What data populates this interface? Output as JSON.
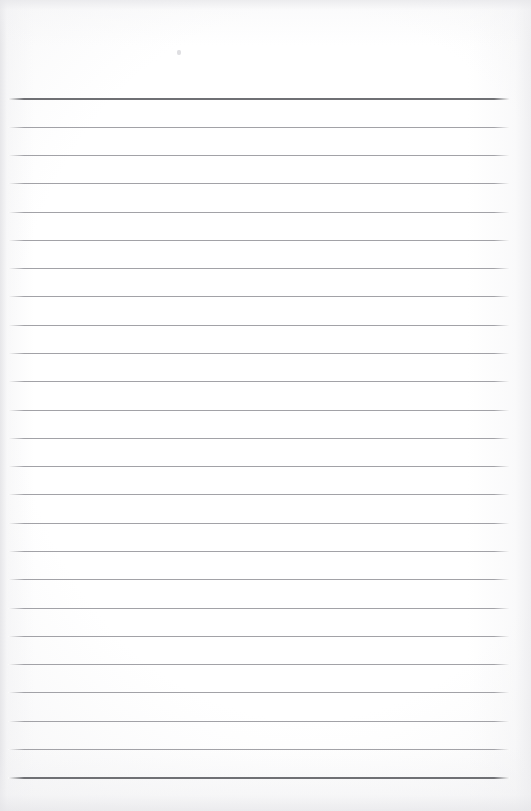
{
  "document": {
    "kind": "scanned-lined-paper",
    "title": "Blank ruled notebook page",
    "orientation": "portrait",
    "page_width_px": 531,
    "page_height_px": 811,
    "visible_text": "",
    "text_content_present": false
  },
  "colors": {
    "paper": "#fdfdfd",
    "paper_highlight": "#ffffff",
    "edge_shadow": "#e6e6e9",
    "rule_line": "#a2a2a7",
    "rule_line_heavy": "#6f7074",
    "speck": "#c4c4ca"
  },
  "ruling": {
    "style": "wide-ruled",
    "line_count": 25,
    "first_line_y": 98,
    "last_line_y": 777,
    "spacing_px": 28.3,
    "line_left_x": 8,
    "line_right_x": 510,
    "line_length_px": 502,
    "top_margin_px": 98,
    "bottom_margin_px": 34,
    "lines": [
      {
        "index": 1,
        "y": 98,
        "weight": "heavy"
      },
      {
        "index": 2,
        "y": 127,
        "weight": "normal"
      },
      {
        "index": 3,
        "y": 155,
        "weight": "normal"
      },
      {
        "index": 4,
        "y": 183,
        "weight": "normal"
      },
      {
        "index": 5,
        "y": 212,
        "weight": "normal"
      },
      {
        "index": 6,
        "y": 240,
        "weight": "normal"
      },
      {
        "index": 7,
        "y": 268,
        "weight": "normal"
      },
      {
        "index": 8,
        "y": 296,
        "weight": "normal"
      },
      {
        "index": 9,
        "y": 325,
        "weight": "normal"
      },
      {
        "index": 10,
        "y": 353,
        "weight": "normal"
      },
      {
        "index": 11,
        "y": 381,
        "weight": "normal"
      },
      {
        "index": 12,
        "y": 410,
        "weight": "normal"
      },
      {
        "index": 13,
        "y": 438,
        "weight": "normal"
      },
      {
        "index": 14,
        "y": 466,
        "weight": "normal"
      },
      {
        "index": 15,
        "y": 494,
        "weight": "normal"
      },
      {
        "index": 16,
        "y": 523,
        "weight": "normal"
      },
      {
        "index": 17,
        "y": 551,
        "weight": "normal"
      },
      {
        "index": 18,
        "y": 579,
        "weight": "normal"
      },
      {
        "index": 19,
        "y": 608,
        "weight": "normal"
      },
      {
        "index": 20,
        "y": 636,
        "weight": "normal"
      },
      {
        "index": 21,
        "y": 664,
        "weight": "normal"
      },
      {
        "index": 22,
        "y": 692,
        "weight": "normal"
      },
      {
        "index": 23,
        "y": 721,
        "weight": "normal"
      },
      {
        "index": 24,
        "y": 749,
        "weight": "normal"
      },
      {
        "index": 25,
        "y": 777,
        "weight": "heavy"
      }
    ]
  },
  "marks": [
    {
      "name": "dust-speck",
      "x": 177,
      "y": 50,
      "width": 4,
      "height": 5
    }
  ]
}
